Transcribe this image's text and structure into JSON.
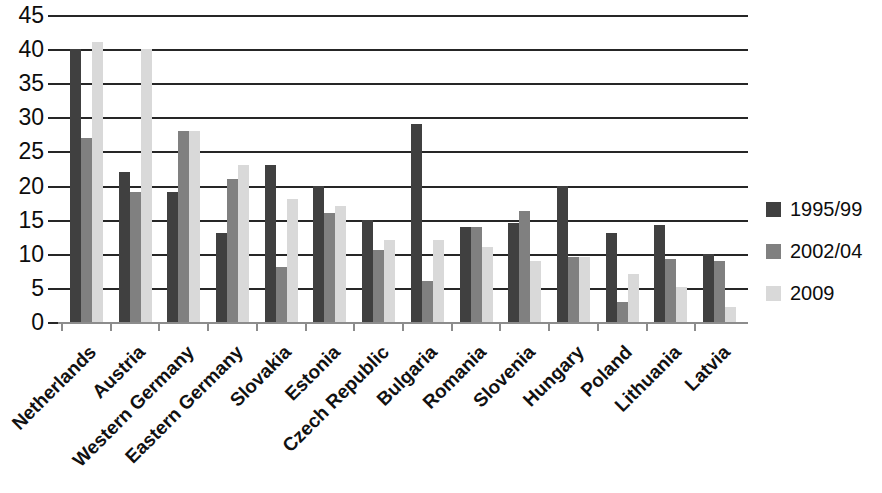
{
  "chart_data": {
    "type": "bar",
    "title": "",
    "subtitle": "",
    "xlabel": "",
    "ylabel": "",
    "ylim": [
      0,
      45
    ],
    "ytick_step": 5,
    "yticks": [
      45,
      40,
      35,
      30,
      25,
      20,
      15,
      10,
      5,
      0
    ],
    "grid": true,
    "legend_position": "right",
    "categories": [
      "Netherlands",
      "Austria",
      "Western Germany",
      "Eastern Germany",
      "Slovakia",
      "Estonia",
      "Czech Republic",
      "Bulgaria",
      "Romania",
      "Slovenia",
      "Hungary",
      "Poland",
      "Lithuania",
      "Latvia"
    ],
    "series": [
      {
        "name": "1995/99",
        "color": "#404040",
        "values": [
          40,
          22,
          19,
          13,
          23,
          20,
          15,
          29,
          14,
          14.5,
          20,
          13,
          14.2,
          10
        ]
      },
      {
        "name": "2002/04",
        "color": "#808080",
        "values": [
          27,
          19,
          28,
          21,
          8,
          16,
          10.5,
          6,
          14,
          16.2,
          9.5,
          3,
          9.2,
          9
        ]
      },
      {
        "name": "2009",
        "color": "#d9d9d9",
        "values": [
          41,
          40,
          28,
          23,
          18,
          17,
          12,
          12,
          11,
          9,
          9.5,
          7,
          5.2,
          2.2
        ]
      }
    ]
  },
  "colors": {
    "series_1995_99": "#404040",
    "series_2002_04": "#808080",
    "series_2009": "#d9d9d9",
    "gridline": "#262626",
    "axis": "#8c8c8c",
    "background": "#ffffff",
    "text": "#0d0d0d"
  }
}
